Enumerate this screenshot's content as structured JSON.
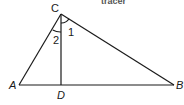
{
  "diagram": {
    "type": "right triangle with altitude",
    "header_fragment": "tracer",
    "points": {
      "C": {
        "label": "C",
        "x": 61,
        "y": 14
      },
      "A": {
        "label": "A",
        "x": 19,
        "y": 85
      },
      "D": {
        "label": "D",
        "x": 61,
        "y": 85
      },
      "B": {
        "label": "B",
        "x": 174,
        "y": 85
      }
    },
    "segments": [
      "CA",
      "CB",
      "AB",
      "CD"
    ],
    "angles": [
      {
        "label": "1",
        "between": "DC-CB"
      },
      {
        "label": "2",
        "between": "AC-CD"
      }
    ]
  }
}
